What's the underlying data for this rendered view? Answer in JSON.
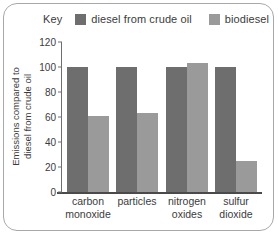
{
  "legend": {
    "key_label": "Key",
    "entries": [
      {
        "label": "diesel from crude oil",
        "color": "#6e6e6e"
      },
      {
        "label": "biodiesel",
        "color": "#9a9a9a"
      }
    ]
  },
  "axis": {
    "ylabel_line1": "Emissions compared to",
    "ylabel_line2": "diesel from crude oil"
  },
  "chart_data": {
    "type": "bar",
    "title": "",
    "xlabel": "",
    "ylabel": "Emissions compared to diesel from crude oil",
    "ylim": [
      0,
      120
    ],
    "yticks": [
      0,
      20,
      40,
      60,
      80,
      100,
      120
    ],
    "ytick_labels": [
      "0",
      "20",
      "40",
      "60",
      "80",
      "100",
      "120"
    ],
    "grid": false,
    "legend_position": "top",
    "categories": [
      "carbon monoxide",
      "particles",
      "nitrogen oxides",
      "sulfur dioxide"
    ],
    "category_lines": [
      [
        "carbon",
        "monoxide"
      ],
      [
        "particles",
        ""
      ],
      [
        "nitrogen",
        "oxides"
      ],
      [
        "sulfur",
        "dioxide"
      ]
    ],
    "series": [
      {
        "name": "diesel from crude oil",
        "color": "#6e6e6e",
        "values": [
          100,
          100,
          100,
          100
        ]
      },
      {
        "name": "biodiesel",
        "color": "#9a9a9a",
        "values": [
          61,
          63,
          103,
          25
        ]
      }
    ]
  }
}
